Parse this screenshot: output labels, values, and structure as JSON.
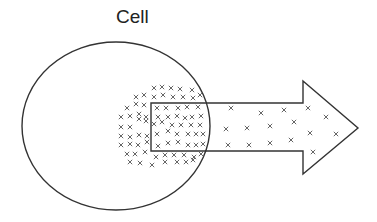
{
  "diagram": {
    "title": "Cell",
    "colors": {
      "outline": "#333333",
      "marker": "#666666",
      "background": "#ffffff"
    },
    "cell": {
      "shape": "ellipse",
      "cx": 116,
      "cy": 126,
      "rx": 94,
      "ry": 84
    },
    "arrow": {
      "direction": "right",
      "points": "151,103 303,103 303,81 358,128 303,174 303,151 151,151"
    },
    "markers": {
      "symbol": "×",
      "description": "molecules concentrated inside cell, diffusing out along arrow",
      "inside_cell": [
        [
          154,
          88
        ],
        [
          162,
          87
        ],
        [
          171,
          88
        ],
        [
          180,
          89
        ],
        [
          192,
          90
        ],
        [
          136,
          97
        ],
        [
          144,
          95
        ],
        [
          154,
          97
        ],
        [
          163,
          95
        ],
        [
          173,
          97
        ],
        [
          183,
          97
        ],
        [
          193,
          98
        ],
        [
          200,
          95
        ],
        [
          127,
          108
        ],
        [
          136,
          104
        ],
        [
          144,
          105
        ],
        [
          157,
          108
        ],
        [
          166,
          108
        ],
        [
          178,
          108
        ],
        [
          187,
          107
        ],
        [
          198,
          107
        ],
        [
          121,
          117
        ],
        [
          130,
          116
        ],
        [
          139,
          114
        ],
        [
          146,
          117
        ],
        [
          158,
          117
        ],
        [
          168,
          117
        ],
        [
          177,
          116
        ],
        [
          185,
          118
        ],
        [
          192,
          117
        ],
        [
          201,
          116
        ],
        [
          121,
          127
        ],
        [
          130,
          127
        ],
        [
          139,
          119
        ],
        [
          146,
          121
        ],
        [
          154,
          124
        ],
        [
          162,
          122
        ],
        [
          172,
          125
        ],
        [
          181,
          125
        ],
        [
          191,
          125
        ],
        [
          200,
          125
        ],
        [
          121,
          136
        ],
        [
          130,
          137
        ],
        [
          139,
          135
        ],
        [
          147,
          136
        ],
        [
          157,
          134
        ],
        [
          168,
          131
        ],
        [
          177,
          134
        ],
        [
          188,
          134
        ],
        [
          196,
          134
        ],
        [
          203,
          134
        ],
        [
          121,
          145
        ],
        [
          130,
          144
        ],
        [
          138,
          145
        ],
        [
          147,
          142
        ],
        [
          158,
          146
        ],
        [
          168,
          143
        ],
        [
          178,
          142
        ],
        [
          188,
          145
        ],
        [
          196,
          145
        ],
        [
          203,
          144
        ],
        [
          127,
          154
        ],
        [
          135,
          154
        ],
        [
          145,
          152
        ],
        [
          156,
          157
        ],
        [
          165,
          155
        ],
        [
          174,
          155
        ],
        [
          184,
          155
        ],
        [
          194,
          157
        ],
        [
          201,
          154
        ],
        [
          130,
          162
        ],
        [
          140,
          163
        ],
        [
          152,
          165
        ],
        [
          165,
          162
        ],
        [
          177,
          162
        ],
        [
          186,
          162
        ],
        [
          193,
          160
        ]
      ],
      "in_arrow": [
        [
          231,
          108
        ],
        [
          261,
          113
        ],
        [
          284,
          110
        ],
        [
          308,
          108
        ],
        [
          326,
          117
        ],
        [
          226,
          129
        ],
        [
          247,
          128
        ],
        [
          270,
          126
        ],
        [
          294,
          122
        ],
        [
          310,
          133
        ],
        [
          336,
          134
        ],
        [
          228,
          145
        ],
        [
          249,
          145
        ],
        [
          270,
          143
        ],
        [
          291,
          140
        ],
        [
          313,
          152
        ]
      ]
    }
  }
}
